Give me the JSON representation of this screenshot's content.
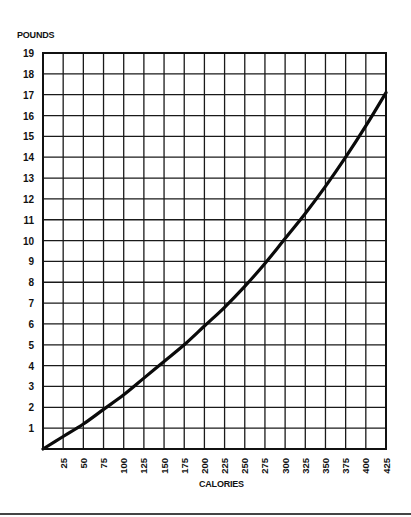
{
  "chart_data": {
    "type": "line",
    "title": "",
    "xlabel": "CALORIES",
    "ylabel": "POUNDS",
    "xlim": [
      0,
      425
    ],
    "ylim": [
      0,
      19
    ],
    "grid": true,
    "legend": null,
    "x_ticks": [
      25,
      50,
      75,
      100,
      125,
      150,
      175,
      200,
      225,
      250,
      275,
      300,
      325,
      350,
      375,
      400,
      425
    ],
    "x_tick_labels": [
      "25",
      "50",
      "75",
      "100",
      "125",
      "150",
      "175",
      "200",
      "225",
      "250",
      "275",
      "300",
      "325",
      "350",
      "375",
      "400",
      "425"
    ],
    "y_ticks": [
      1,
      2,
      3,
      4,
      5,
      6,
      7,
      8,
      9,
      10,
      11,
      12,
      13,
      14,
      15,
      16,
      17,
      18,
      19
    ],
    "y_tick_labels": [
      "1",
      "2",
      "3",
      "4",
      "5",
      "6",
      "7",
      "8",
      "9",
      "10",
      "11",
      "12",
      "13",
      "14",
      "15",
      "16",
      "17",
      "18",
      "19"
    ],
    "series": [
      {
        "name": "Pounds vs Calories",
        "x": [
          0,
          25,
          50,
          75,
          100,
          125,
          150,
          175,
          200,
          225,
          250,
          275,
          300,
          325,
          350,
          375,
          400,
          425
        ],
        "y": [
          0,
          0.6,
          1.2,
          1.9,
          2.6,
          3.4,
          4.2,
          5.0,
          5.9,
          6.8,
          7.8,
          8.9,
          10.1,
          11.3,
          12.6,
          14.0,
          15.5,
          17.1
        ]
      }
    ]
  },
  "labels": {
    "ylabel": "POUNDS",
    "xlabel": "CALORIES"
  }
}
